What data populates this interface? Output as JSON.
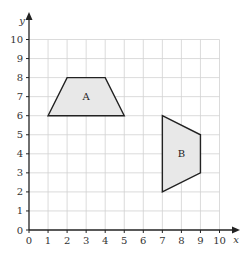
{
  "chart_data": {
    "type": "coordinate-grid",
    "title": "",
    "xlabel": "x",
    "ylabel": "y",
    "xlim": [
      0,
      10
    ],
    "ylim": [
      0,
      10
    ],
    "grid": true,
    "x_ticks": [
      "0",
      "1",
      "2",
      "3",
      "4",
      "5",
      "6",
      "7",
      "8",
      "9",
      "10"
    ],
    "y_ticks": [
      "0",
      "1",
      "2",
      "3",
      "4",
      "5",
      "6",
      "7",
      "8",
      "9",
      "10"
    ],
    "shapes": [
      {
        "name": "A",
        "type": "trapezium",
        "vertices": [
          [
            1,
            6
          ],
          [
            2,
            8
          ],
          [
            4,
            8
          ],
          [
            5,
            6
          ]
        ],
        "label_pos": [
          3,
          7
        ]
      },
      {
        "name": "B",
        "type": "trapezium",
        "vertices": [
          [
            7,
            6
          ],
          [
            9,
            5
          ],
          [
            9,
            3
          ],
          [
            7,
            2
          ]
        ],
        "label_pos": [
          8,
          4
        ]
      }
    ]
  },
  "colors": {
    "grid": "#d2d2d2",
    "axis": "#222222",
    "shape_stroke": "#222222",
    "shape_fill": "#e8e8e8",
    "text": "#333333"
  },
  "layout": {
    "origin_x": 29,
    "origin_y": 230,
    "unit": 19.05,
    "x_arrow_end": 240,
    "y_arrow_end": 12
  }
}
